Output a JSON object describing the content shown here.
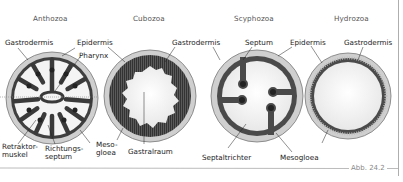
{
  "figure": {
    "caption": "Abb. 24.2",
    "panels": [
      {
        "title": "Anthozoa",
        "labels": {
          "gastrodermis": "Gastrodermis",
          "epidermis": "Epidermis",
          "pharynx": "Pharynx",
          "retraktor_1": "Retraktor-",
          "retraktor_2": "muskel",
          "richtung_1": "Richtungs-",
          "richtung_2": "septum",
          "meso_1": "Meso-",
          "meso_2": "gloea"
        }
      },
      {
        "title": "Cubozoa",
        "labels": {
          "gastrodermis": "Gastrodermis",
          "gastralraum": "Gastralraum"
        }
      },
      {
        "title": "Scyphozoa",
        "labels": {
          "septum": "Septum",
          "epidermis": "Epidermis",
          "septaltrichter": "Septaltrichter",
          "mesogloea": "Mesogloea"
        }
      },
      {
        "title": "Hydrozoa",
        "labels": {
          "gastrodermis": "Gastrodermis"
        }
      }
    ],
    "colors": {
      "outer_ring": "#c9c9c9",
      "tissue_dark": "#4a4a4a",
      "cavity": "#f2f2f2",
      "border": "#9a9a9a"
    }
  }
}
